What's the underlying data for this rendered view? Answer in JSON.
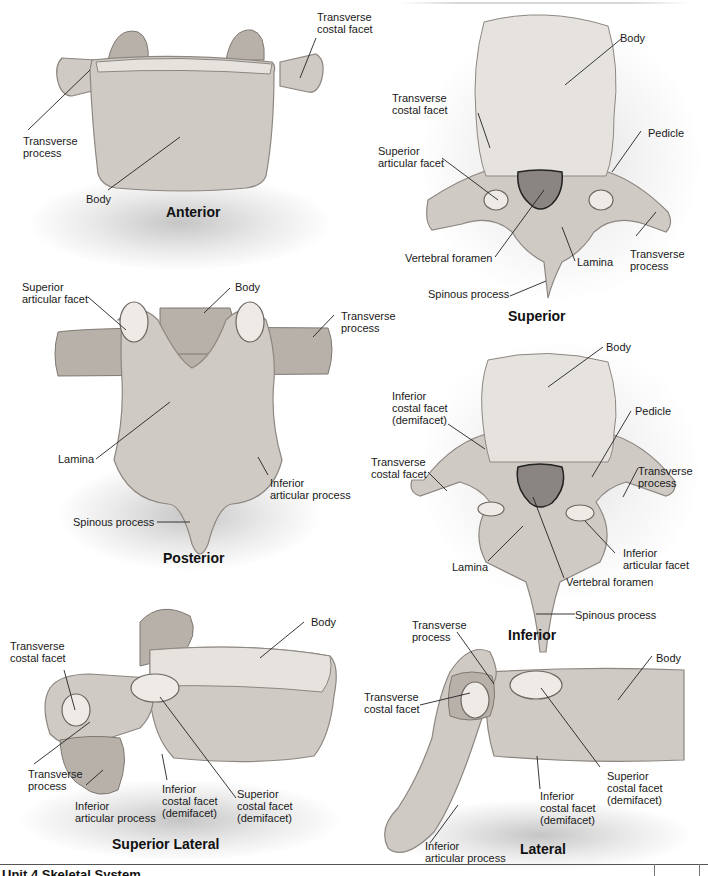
{
  "footer": {
    "unit_title": "Unit 4 Skeletal System"
  },
  "views": {
    "anterior": {
      "title": "Anterior",
      "labels": {
        "transverse_costal_facet": "Transverse\ncostal facet",
        "transverse_process": "Transverse\nprocess",
        "body": "Body"
      }
    },
    "superior": {
      "title": "Superior",
      "labels": {
        "body": "Body",
        "transverse_costal_facet": "Transverse\ncostal facet",
        "pedicle": "Pedicle",
        "superior_articular_facet": "Superior\narticular facet",
        "vertebral_foramen": "Vertebral foramen",
        "lamina": "Lamina",
        "transverse_process": "Transverse\nprocess",
        "spinous_process": "Spinous process"
      }
    },
    "posterior": {
      "title": "Posterior",
      "labels": {
        "superior_articular_facet": "Superior\narticular facet",
        "body": "Body",
        "transverse_process": "Transverse\nprocess",
        "lamina": "Lamina",
        "inferior_articular_process": "Inferior\narticular process",
        "spinous_process": "Spinous process"
      }
    },
    "inferior": {
      "title": "Inferior",
      "labels": {
        "body": "Body",
        "inferior_costal_facet": "Inferior\ncostal facet\n(demifacet)",
        "pedicle": "Pedicle",
        "transverse_costal_facet": "Transverse\ncostal facet",
        "transverse_process": "Transverse\nprocess",
        "inferior_articular_facet": "Inferior\narticular facet",
        "lamina": "Lamina",
        "vertebral_foramen": "Vertebral foramen",
        "spinous_process": "Spinous process"
      }
    },
    "superior_lateral": {
      "title": "Superior Lateral",
      "labels": {
        "body": "Body",
        "transverse_costal_facet": "Transverse\ncostal facet",
        "transverse_process": "Transverse\nprocess",
        "inferior_articular_process": "Inferior\narticular process",
        "inferior_costal_facet": "Inferior\ncostal facet\n(demifacet)",
        "superior_costal_facet": "Superior\ncostal facet\n(demifacet)"
      }
    },
    "lateral": {
      "title": "Lateral",
      "labels": {
        "transverse_process": "Transverse\nprocess",
        "body": "Body",
        "transverse_costal_facet": "Transverse\ncostal facet",
        "superior_costal_facet": "Superior\ncostal facet\n(demifacet)",
        "inferior_costal_facet": "Inferior\ncostal facet\n(demifacet)",
        "inferior_articular_process": "Inferior\narticular process"
      }
    }
  }
}
